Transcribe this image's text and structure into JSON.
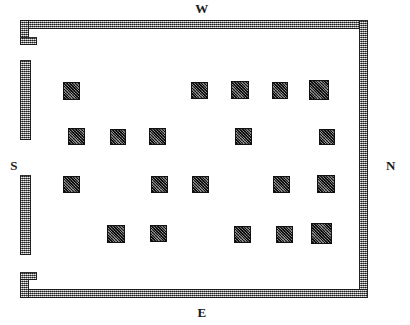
{
  "plan": {
    "title": "Floor plan",
    "canvas": {
      "width": 410,
      "height": 325
    },
    "background": "#ffffff",
    "ink": "#1a1a1a",
    "wall_fill": "#9b9b9b",
    "pillar_fill": "#4a4a4a"
  },
  "compass": {
    "north": "N",
    "south": "S",
    "east": "E",
    "west": "W"
  },
  "walls": [
    {
      "name": "wall-top",
      "x": 20,
      "y": 20,
      "w": 348,
      "h": 9
    },
    {
      "name": "wall-right",
      "x": 359,
      "y": 20,
      "w": 9,
      "h": 278
    },
    {
      "name": "wall-bottom",
      "x": 20,
      "y": 289,
      "w": 348,
      "h": 9
    },
    {
      "name": "wall-left-corner-top",
      "x": 20,
      "y": 20,
      "w": 9,
      "h": 25
    },
    {
      "name": "wall-left-notch-top",
      "x": 20,
      "y": 37,
      "w": 17,
      "h": 8
    },
    {
      "name": "wall-left-upper",
      "x": 20,
      "y": 60,
      "w": 11,
      "h": 80
    },
    {
      "name": "wall-left-lower",
      "x": 20,
      "y": 175,
      "w": 11,
      "h": 80
    },
    {
      "name": "wall-left-corner-bottom",
      "x": 20,
      "y": 272,
      "w": 9,
      "h": 26
    },
    {
      "name": "wall-left-notch-bottom",
      "x": 20,
      "y": 272,
      "w": 17,
      "h": 8
    }
  ],
  "floor": {
    "x": 29,
    "y": 29,
    "w": 330,
    "h": 260
  },
  "pillars": [
    {
      "row": 1,
      "col": 1,
      "x": 63,
      "y": 82,
      "w": 17,
      "h": 18,
      "shadow": "left"
    },
    {
      "row": 1,
      "col": 2,
      "x": 191,
      "y": 82,
      "w": 17,
      "h": 17,
      "shadow": "none"
    },
    {
      "row": 1,
      "col": 3,
      "x": 231,
      "y": 81,
      "w": 18,
      "h": 18,
      "shadow": "none"
    },
    {
      "row": 1,
      "col": 4,
      "x": 272,
      "y": 82,
      "w": 16,
      "h": 17,
      "shadow": "none"
    },
    {
      "row": 1,
      "col": 5,
      "x": 309,
      "y": 80,
      "w": 20,
      "h": 20,
      "shadow": "right"
    },
    {
      "row": 2,
      "col": 1,
      "x": 68,
      "y": 128,
      "w": 17,
      "h": 17,
      "shadow": "none"
    },
    {
      "row": 2,
      "col": 2,
      "x": 110,
      "y": 129,
      "w": 16,
      "h": 16,
      "shadow": "none"
    },
    {
      "row": 2,
      "col": 3,
      "x": 149,
      "y": 128,
      "w": 17,
      "h": 17,
      "shadow": "none"
    },
    {
      "row": 2,
      "col": 4,
      "x": 235,
      "y": 128,
      "w": 17,
      "h": 17,
      "shadow": "none"
    },
    {
      "row": 2,
      "col": 5,
      "x": 319,
      "y": 129,
      "w": 16,
      "h": 16,
      "shadow": "none"
    },
    {
      "row": 3,
      "col": 1,
      "x": 63,
      "y": 176,
      "w": 17,
      "h": 17,
      "shadow": "none"
    },
    {
      "row": 3,
      "col": 2,
      "x": 151,
      "y": 176,
      "w": 17,
      "h": 17,
      "shadow": "none"
    },
    {
      "row": 3,
      "col": 3,
      "x": 192,
      "y": 176,
      "w": 17,
      "h": 17,
      "shadow": "none"
    },
    {
      "row": 3,
      "col": 4,
      "x": 273,
      "y": 176,
      "w": 17,
      "h": 17,
      "shadow": "none"
    },
    {
      "row": 3,
      "col": 5,
      "x": 317,
      "y": 175,
      "w": 18,
      "h": 18,
      "shadow": "none"
    },
    {
      "row": 4,
      "col": 1,
      "x": 107,
      "y": 225,
      "w": 18,
      "h": 18,
      "shadow": "left"
    },
    {
      "row": 4,
      "col": 2,
      "x": 150,
      "y": 225,
      "w": 17,
      "h": 17,
      "shadow": "none"
    },
    {
      "row": 4,
      "col": 3,
      "x": 234,
      "y": 226,
      "w": 17,
      "h": 17,
      "shadow": "none"
    },
    {
      "row": 4,
      "col": 4,
      "x": 276,
      "y": 226,
      "w": 17,
      "h": 17,
      "shadow": "none"
    },
    {
      "row": 4,
      "col": 5,
      "x": 311,
      "y": 223,
      "w": 21,
      "h": 21,
      "shadow": "right"
    }
  ],
  "counts": {
    "pillar_total": "20",
    "rows": "4"
  }
}
